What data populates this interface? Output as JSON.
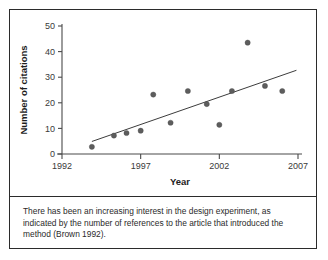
{
  "figure": {
    "caption": "There has been an increasing interest in the design experiment, as indicated by the number of references to the article that introduced the method (Brown 1992)."
  },
  "chart_data": {
    "type": "scatter",
    "title": "",
    "xlabel": "Year",
    "ylabel": "Number of citations",
    "xlim": [
      1992,
      2007
    ],
    "ylim": [
      0,
      50
    ],
    "xticks": [
      "1992",
      "1997",
      "2002",
      "2007"
    ],
    "xtick_values": [
      1992,
      1997,
      2002,
      2007
    ],
    "yticks": [
      "0",
      "10",
      "20",
      "30",
      "40",
      "50"
    ],
    "ytick_values": [
      0,
      10,
      20,
      30,
      40,
      50
    ],
    "grid": false,
    "legend": "none",
    "marker_color": "#5d5d5d",
    "line_color": "#3c3c3c",
    "axis_color": "#4a4a4a",
    "points": [
      {
        "x": 1993.9,
        "y": 2.8
      },
      {
        "x": 1995.3,
        "y": 7.2
      },
      {
        "x": 1996.1,
        "y": 8.2
      },
      {
        "x": 1997.0,
        "y": 9.1
      },
      {
        "x": 1997.8,
        "y": 23.2
      },
      {
        "x": 1998.9,
        "y": 12.2
      },
      {
        "x": 2000.0,
        "y": 24.6
      },
      {
        "x": 2001.2,
        "y": 19.5
      },
      {
        "x": 2002.0,
        "y": 11.4
      },
      {
        "x": 2002.8,
        "y": 24.6
      },
      {
        "x": 2003.8,
        "y": 43.5
      },
      {
        "x": 2004.9,
        "y": 26.6
      },
      {
        "x": 2006.0,
        "y": 24.6
      }
    ],
    "trend_line": {
      "x_start": 1993.9,
      "y_start": 4.9,
      "x_end": 2006.9,
      "y_end": 32.7
    }
  }
}
